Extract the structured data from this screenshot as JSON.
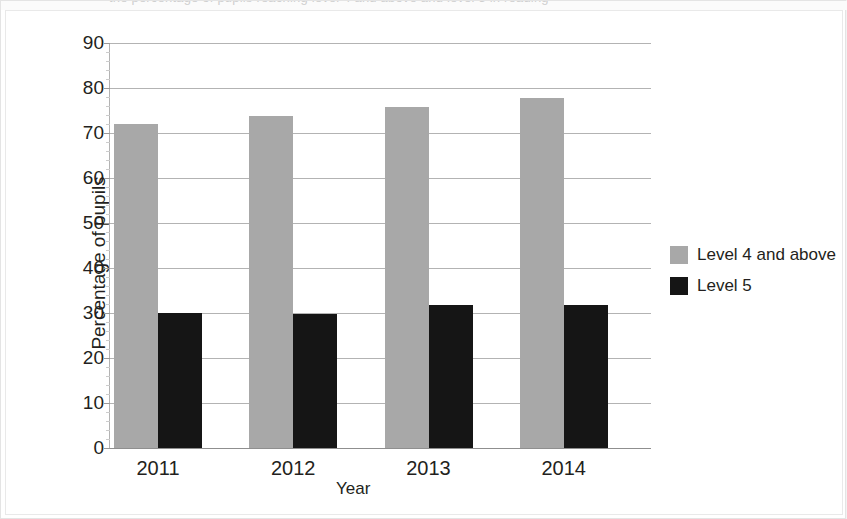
{
  "chart_data": {
    "type": "bar",
    "title": "",
    "subtitle": "",
    "categories": [
      "2011",
      "2012",
      "2013",
      "2014"
    ],
    "series": [
      {
        "name": "Level 4 and above",
        "color": "#a8a8a8",
        "values": [
          72,
          73.8,
          75.8,
          77.8
        ]
      },
      {
        "name": "Level 5",
        "color": "#151515",
        "values": [
          30,
          29.8,
          31.8,
          31.8
        ]
      }
    ],
    "xlabel": "Year",
    "ylabel": "Percentage of pupils",
    "ylim": [
      0,
      90
    ],
    "ytick_step": 10,
    "yticks": [
      0,
      10,
      20,
      30,
      40,
      50,
      60,
      70,
      80,
      90
    ],
    "ytick_labels": [
      "0",
      "10",
      "20",
      "30",
      "40",
      "50",
      "60",
      "70",
      "80",
      "90"
    ],
    "minor_ticks_per_interval": 4,
    "grid": true,
    "grid_axis": "y",
    "legend_position": "right",
    "background": "#ffffff",
    "grid_color": "#b3b3b3",
    "text_color": "#231f20"
  },
  "figure": {
    "frame_border_color": "#e9e9e9",
    "page_background": "#f2f2f2",
    "top_clipped_caption": "the percentage of pupils reaching level 4 and above and level 5 in reading"
  }
}
